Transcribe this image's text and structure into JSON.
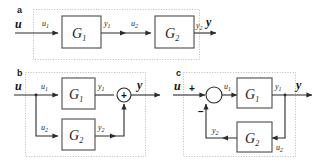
{
  "figure": {
    "type": "block-diagram",
    "panels": [
      {
        "id": "a",
        "label": "a",
        "interconnection": "series",
        "input_signal": "u",
        "output_signal": "y",
        "blocks": [
          {
            "name": "G",
            "subscript": "1",
            "input": "u",
            "input_sub": "1",
            "output": "y",
            "output_sub": "1"
          },
          {
            "name": "G",
            "subscript": "2",
            "input": "u",
            "input_sub": "2",
            "output": "y",
            "output_sub": "2"
          }
        ],
        "junctions": []
      },
      {
        "id": "b",
        "label": "b",
        "interconnection": "parallel",
        "input_signal": "u",
        "output_signal": "y",
        "blocks": [
          {
            "name": "G",
            "subscript": "1",
            "input": "u",
            "input_sub": "1",
            "output": "y",
            "output_sub": "1"
          },
          {
            "name": "G",
            "subscript": "2",
            "input": "u",
            "input_sub": "2",
            "output": "y",
            "output_sub": "2"
          }
        ],
        "junctions": [
          {
            "symbol": "+",
            "kind": "summing-node-plus"
          }
        ]
      },
      {
        "id": "c",
        "label": "c",
        "interconnection": "feedback",
        "input_signal": "u",
        "output_signal": "y",
        "blocks": [
          {
            "name": "G",
            "subscript": "1",
            "input": "u",
            "input_sub": "1",
            "output": "y",
            "output_sub": "1"
          },
          {
            "name": "G",
            "subscript": "2",
            "input": "u",
            "input_sub": "2",
            "output": "y",
            "output_sub": "2"
          }
        ],
        "junctions": [
          {
            "symbol": "",
            "kind": "summing-node-empty",
            "signs": [
              "+",
              "−"
            ]
          }
        ]
      }
    ]
  },
  "labels": {
    "panel_a": "a",
    "panel_b": "b",
    "panel_c": "c",
    "u_bold": "u",
    "y_bold": "y",
    "u1": "u",
    "u1_sub": "1",
    "u2": "u",
    "u2_sub": "2",
    "y1": "y",
    "y1_sub": "1",
    "y2": "y",
    "y2_sub": "2",
    "G1": "G",
    "G1_sub": "1",
    "G2": "G",
    "G2_sub": "2",
    "plus": "+",
    "minus": "−"
  },
  "colors": {
    "background": "#ffffff",
    "wire": "#2b2b2b",
    "block_stroke": "#5a5a5a",
    "dotted_border": "#b9b9b9",
    "text": "#1a1a1a"
  }
}
